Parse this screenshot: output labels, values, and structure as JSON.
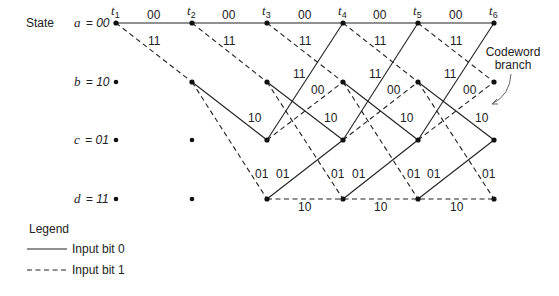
{
  "diagram": {
    "state_heading": "State",
    "states": [
      {
        "id": "a",
        "name": "a",
        "value": "00",
        "label": "a = 00"
      },
      {
        "id": "b",
        "name": "b",
        "value": "10",
        "label": "b = 10"
      },
      {
        "id": "c",
        "name": "c",
        "value": "01",
        "label": "c = 01"
      },
      {
        "id": "d",
        "name": "d",
        "value": "11",
        "label": "d = 11"
      }
    ],
    "times": [
      "t1",
      "t2",
      "t3",
      "t4",
      "t5",
      "t6"
    ],
    "time_labels": [
      {
        "base": "t",
        "sub": "1"
      },
      {
        "base": "t",
        "sub": "2"
      },
      {
        "base": "t",
        "sub": "3"
      },
      {
        "base": "t",
        "sub": "4"
      },
      {
        "base": "t",
        "sub": "5"
      },
      {
        "base": "t",
        "sub": "6"
      }
    ],
    "branch_codewords": {
      "a_to_a": "00",
      "a_to_b": "11",
      "b_to_c": "10",
      "b_to_d": "01",
      "c_to_a": "11",
      "c_to_b": "00",
      "d_to_c": "01",
      "d_to_d": "10"
    },
    "annotation": {
      "line1": "Codeword",
      "line2": "branch"
    },
    "legend": {
      "title": "Legend",
      "items": [
        {
          "style": "solid",
          "label": "Input bit 0"
        },
        {
          "style": "dashed",
          "label": "Input bit 1"
        }
      ]
    }
  }
}
